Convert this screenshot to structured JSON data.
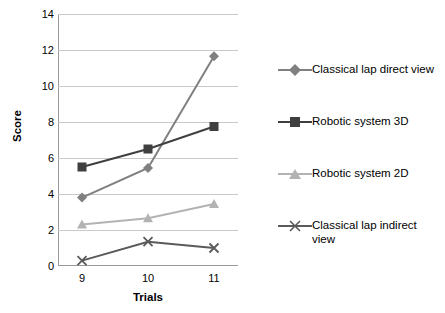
{
  "chart_data": {
    "type": "line",
    "title": "",
    "xlabel": "Trials",
    "ylabel": "Score",
    "categories": [
      "9",
      "10",
      "11"
    ],
    "x": [
      9,
      10,
      11
    ],
    "ylim": [
      0,
      14
    ],
    "yticks": [
      "0",
      "2",
      "4",
      "6",
      "8",
      "10",
      "12",
      "14"
    ],
    "grid": "horizontal",
    "legend_position": "right",
    "series": [
      {
        "name": "Classical lap direct view",
        "values": [
          3.8,
          5.45,
          11.65
        ],
        "color": "#808080",
        "marker": "diamond"
      },
      {
        "name": "Robotic system 3D",
        "values": [
          5.5,
          6.5,
          7.75
        ],
        "color": "#3f3f3f",
        "marker": "square"
      },
      {
        "name": "Robotic system 2D",
        "values": [
          2.3,
          2.65,
          3.45
        ],
        "color": "#b3b3b3",
        "marker": "triangle"
      },
      {
        "name": "Classical lap indirect view",
        "values": [
          0.3,
          1.35,
          1.0
        ],
        "color": "#5a5a5a",
        "marker": "cross"
      }
    ]
  },
  "legend": {
    "items": [
      {
        "label": "Classical lap direct view"
      },
      {
        "label": "Robotic system 3D"
      },
      {
        "label": "Robotic system 2D"
      },
      {
        "label": "Classical lap indirect view"
      }
    ]
  }
}
